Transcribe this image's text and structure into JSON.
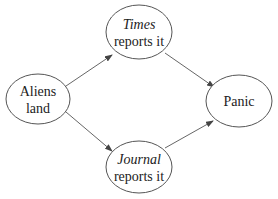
{
  "diagram": {
    "type": "directed-graph",
    "nodes": [
      {
        "id": "aliens",
        "line1": "Aliens",
        "line2": "land",
        "line1_italic": false
      },
      {
        "id": "times",
        "line1": "Times",
        "line2": "reports it",
        "line1_italic": true
      },
      {
        "id": "journal",
        "line1": "Journal",
        "line2": "reports it",
        "line1_italic": true
      },
      {
        "id": "panic",
        "line1": "Panic",
        "line2": "",
        "line1_italic": false
      }
    ],
    "edges": [
      {
        "from": "aliens",
        "to": "times"
      },
      {
        "from": "aliens",
        "to": "journal"
      },
      {
        "from": "times",
        "to": "panic"
      },
      {
        "from": "journal",
        "to": "panic"
      }
    ],
    "colors": {
      "stroke": "#555555",
      "text": "#222222",
      "background": "#ffffff"
    }
  }
}
